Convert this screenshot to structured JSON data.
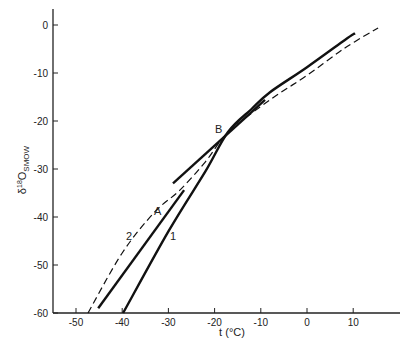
{
  "chart_data": {
    "type": "line",
    "title": "",
    "xlabel": "t (°C)",
    "ylabel": "δ18O SMOW",
    "ylabel_main": "δ",
    "ylabel_sup": "18",
    "ylabel_o": "O",
    "ylabel_sub": "SMOW",
    "xlim": [
      -55,
      18
    ],
    "ylim": [
      -60,
      3
    ],
    "grid": false,
    "x_ticks": [
      -50,
      -40,
      -30,
      -20,
      -10,
      0,
      10
    ],
    "y_ticks": [
      0,
      -10,
      -20,
      -30,
      -40,
      -50,
      -60
    ],
    "x_tick_labels": [
      "-50",
      "-40",
      "-30",
      "-20",
      "-10",
      "0",
      "10"
    ],
    "y_tick_labels": [
      "0",
      "-10",
      "-20",
      "-30",
      "-40",
      "-50",
      "-60"
    ],
    "series": [
      {
        "name": "1",
        "style": "solid-thick",
        "x": [
          -39.8,
          -30,
          -22,
          -17.1,
          -12,
          -8,
          0,
          8.2,
          10.4
        ],
        "y": [
          -60,
          -43,
          -30.5,
          -22.3,
          -17.5,
          -14,
          -8.8,
          -3.1,
          -1.7
        ]
      },
      {
        "name": "2",
        "style": "dashed",
        "x": [
          -47.4,
          -40,
          -33,
          -27.5,
          -22,
          -17,
          -8,
          0,
          8.2,
          15.4
        ],
        "y": [
          -60,
          -47.5,
          -39,
          -34.4,
          -28.5,
          -22.3,
          -15.6,
          -10.5,
          -4.8,
          -0.6
        ]
      },
      {
        "name": "A",
        "style": "solid-thick",
        "x": [
          -45.2,
          -26.6
        ],
        "y": [
          -59,
          -34.4
        ]
      },
      {
        "name": "B-line",
        "style": "solid-thick",
        "x": [
          -29,
          -9.1
        ],
        "y": [
          -33,
          -15.6
        ]
      }
    ],
    "annotations": [
      {
        "text": "A",
        "x": -32.3,
        "y": -39.6
      },
      {
        "text": "B",
        "x": -19.1,
        "y": -22.5
      },
      {
        "text": "1",
        "x": -29,
        "y": -44.8
      },
      {
        "text": "2",
        "x": -38.5,
        "y": -44.8
      }
    ],
    "legend": null
  }
}
